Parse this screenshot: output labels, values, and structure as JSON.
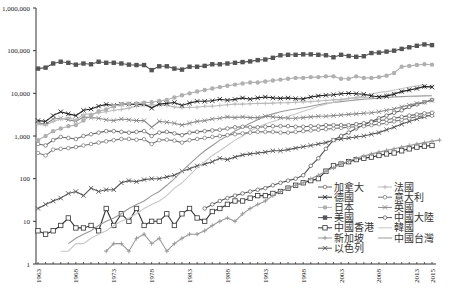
{
  "chart_data": {
    "type": "line",
    "title": "",
    "xlabel": "",
    "ylabel": "",
    "yscale": "log",
    "ylim": [
      1,
      1000000
    ],
    "xlim": [
      1963,
      2015
    ],
    "grid": false,
    "legend_position": "bottom-right",
    "y_ticks": [
      {
        "value": 1,
        "label": "1"
      },
      {
        "value": 10,
        "label": "10"
      },
      {
        "value": 100,
        "label": "100"
      },
      {
        "value": 1000,
        "label": "1,000"
      },
      {
        "value": 10000,
        "label": "10,000"
      },
      {
        "value": 100000,
        "label": "100,000"
      },
      {
        "value": 1000000,
        "label": "1,000,000"
      }
    ],
    "x_ticks": [
      "1963",
      "1968",
      "1973",
      "1978",
      "1983",
      "1988",
      "1993",
      "1998",
      "2003",
      "2008",
      "2013",
      "2015"
    ],
    "legend_columns": [
      [
        "加拿大",
        "德國",
        "日本",
        "美國",
        "中國香港",
        "新加坡",
        "以色列"
      ],
      [
        "法國",
        "意大利",
        "英國",
        "中國大陸",
        "韓國",
        "中國台灣"
      ]
    ],
    "series": [
      {
        "name": "美國",
        "color": "#555555",
        "marker": "square-filled",
        "start": 1963,
        "values": [
          38000,
          40000,
          50000,
          55000,
          52000,
          47000,
          50000,
          48000,
          55000,
          52000,
          52000,
          50000,
          47000,
          46000,
          46000,
          35000,
          43000,
          43000,
          38000,
          36000,
          42000,
          42000,
          44000,
          48000,
          48000,
          50000,
          52000,
          54000,
          56000,
          60000,
          62000,
          68000,
          78000,
          80000,
          80000,
          82000,
          82000,
          80000,
          78000,
          70000,
          80000,
          75000,
          72000,
          74000,
          88000,
          90000,
          95000,
          100000,
          110000,
          120000,
          130000,
          140000,
          135000
        ]
      },
      {
        "name": "日本",
        "color": "#b0b0b0",
        "marker": "circle-filled",
        "start": 1963,
        "values": [
          800,
          1000,
          1300,
          1500,
          1700,
          1800,
          2300,
          3000,
          3800,
          4200,
          5000,
          5500,
          5700,
          5800,
          6000,
          6200,
          6600,
          7000,
          8000,
          9000,
          10000,
          11000,
          12000,
          13000,
          14000,
          15000,
          16000,
          17000,
          18000,
          18000,
          19000,
          20000,
          21000,
          22000,
          23000,
          23000,
          24000,
          24000,
          25000,
          25000,
          22000,
          22000,
          25000,
          23000,
          23000,
          24000,
          26000,
          30000,
          42000,
          44000,
          46000,
          48000,
          47000
        ]
      },
      {
        "name": "德國",
        "color": "#222222",
        "marker": "x",
        "start": 1963,
        "values": [
          2300,
          2200,
          3000,
          3700,
          3300,
          3000,
          4000,
          4300,
          5000,
          5500,
          5200,
          5600,
          5600,
          5500,
          5600,
          4500,
          5600,
          5800,
          6100,
          5200,
          5900,
          6500,
          6500,
          6700,
          7300,
          6900,
          7200,
          7800,
          7300,
          7800,
          8200,
          7800,
          7600,
          7800,
          7500,
          7400,
          8200,
          8700,
          9000,
          9300,
          9800,
          10000,
          9800,
          9500,
          8800,
          8200,
          8600,
          9500,
          11000,
          12000,
          13000,
          14500,
          14000
        ]
      },
      {
        "name": "法國",
        "color": "#bbbbbb",
        "marker": "plus",
        "start": 1963,
        "values": [
          1900,
          1800,
          2200,
          2500,
          2700,
          2400,
          3200,
          3300,
          3500,
          3700,
          4000,
          4200,
          4500,
          5000,
          5200,
          5400,
          5300,
          5200,
          4800,
          4600,
          4700,
          4700,
          5000,
          5000,
          5200,
          5400,
          5600,
          5600,
          5700,
          5800,
          5800,
          5900,
          6000,
          6000,
          6200,
          6300,
          6400,
          6600,
          6800,
          7000,
          7200,
          7600,
          7800,
          8000,
          8200,
          8500,
          9000,
          10000,
          11000,
          12000,
          13000,
          14000,
          14500
        ]
      },
      {
        "name": "英國",
        "color": "#888888",
        "marker": "x",
        "start": 1963,
        "values": [
          2000,
          1900,
          2500,
          2600,
          2400,
          2200,
          2800,
          2700,
          2600,
          2400,
          2300,
          2500,
          2400,
          2300,
          2300,
          1600,
          2200,
          2100,
          2000,
          1800,
          2000,
          2200,
          2300,
          2500,
          2600,
          2800,
          2700,
          2800,
          2700,
          2700,
          2900,
          2800,
          2700,
          2600,
          2600,
          2700,
          2800,
          2900,
          2900,
          3000,
          3100,
          3200,
          3300,
          3400,
          3500,
          3700,
          4000,
          4300,
          4800,
          5300,
          5800,
          6200,
          6800
        ]
      },
      {
        "name": "加拿大",
        "color": "#666666",
        "marker": "circle-open",
        "start": 1963,
        "values": [
          650,
          600,
          800,
          950,
          900,
          850,
          1000,
          1100,
          1200,
          1300,
          1300,
          1250,
          1200,
          1250,
          1300,
          1000,
          1200,
          1250,
          1150,
          1050,
          1200,
          1250,
          1300,
          1350,
          1400,
          1500,
          1600,
          1650,
          1600,
          1600,
          1650,
          1700,
          1700,
          1700,
          1650,
          1650,
          1700,
          1700,
          1800,
          1800,
          1800,
          1800,
          1900,
          2000,
          2100,
          2300,
          2400,
          2600,
          2800,
          3000,
          3200,
          3400,
          3500
        ]
      },
      {
        "name": "意大利",
        "color": "#777777",
        "marker": "circle-open",
        "start": 1963,
        "values": [
          400,
          350,
          480,
          500,
          520,
          550,
          600,
          650,
          700,
          750,
          800,
          850,
          850,
          820,
          840,
          650,
          800,
          820,
          780,
          700,
          800,
          850,
          900,
          950,
          1000,
          1050,
          1100,
          1150,
          1200,
          1250,
          1250,
          1250,
          1200,
          1200,
          1250,
          1300,
          1350,
          1400,
          1450,
          1500,
          1550,
          1600,
          1650,
          1700,
          1800,
          1900,
          2000,
          2200,
          2400,
          2600,
          2800,
          3000,
          3000
        ]
      },
      {
        "name": "中國大陸",
        "color": "#555555",
        "marker": "circle-open",
        "start": 1985,
        "values": [
          20,
          25,
          30,
          35,
          40,
          45,
          50,
          55,
          60,
          70,
          80,
          90,
          100,
          120,
          200,
          300,
          500,
          800,
          1000,
          1200,
          1500,
          1800,
          2200,
          2600,
          3000,
          3500,
          4000,
          4800,
          5500,
          6200,
          7000
        ]
      },
      {
        "name": "韓國",
        "color": "#c8c8c8",
        "marker": "none",
        "start": 1966,
        "values": [
          2,
          2,
          3,
          3,
          4,
          5,
          6,
          8,
          10,
          12,
          15,
          20,
          25,
          30,
          40,
          60,
          80,
          120,
          180,
          250,
          350,
          450,
          600,
          800,
          1000,
          1300,
          1600,
          1900,
          2200,
          2500,
          2900,
          3300,
          3800,
          4300,
          5000,
          5600,
          6200,
          6900,
          7500,
          8200,
          8800,
          9600,
          10500,
          11000,
          12000,
          13000,
          14000,
          15000,
          16000
        ]
      },
      {
        "name": "中國台灣",
        "color": "#999999",
        "marker": "none",
        "start": 1967,
        "values": [
          3,
          4,
          5,
          6,
          8,
          10,
          12,
          15,
          20,
          25,
          30,
          40,
          50,
          70,
          100,
          150,
          220,
          320,
          450,
          600,
          800,
          1000,
          1300,
          1600,
          2000,
          2400,
          2900,
          3300,
          3700,
          4000,
          4300,
          4600,
          5000,
          5400,
          5800,
          6100,
          6400,
          6700,
          7000,
          7300,
          7500,
          7700,
          8000,
          8200,
          8400,
          8500,
          8600,
          8700,
          8800
        ]
      },
      {
        "name": "以色列",
        "color": "#555555",
        "marker": "x",
        "start": 1963,
        "values": [
          20,
          25,
          30,
          35,
          45,
          50,
          40,
          60,
          50,
          55,
          55,
          80,
          90,
          85,
          95,
          100,
          100,
          110,
          120,
          150,
          170,
          200,
          220,
          250,
          300,
          280,
          320,
          360,
          380,
          400,
          420,
          450,
          450,
          480,
          520,
          560,
          600,
          650,
          700,
          800,
          850,
          900,
          950,
          1000,
          1100,
          1200,
          1400,
          1600,
          1900,
          2200,
          2500,
          2800,
          3200
        ]
      },
      {
        "name": "新加坡",
        "color": "#999999",
        "marker": "plus",
        "start": 1972,
        "values": [
          2,
          3,
          3,
          2,
          4,
          5,
          3,
          4,
          2,
          3,
          4,
          5,
          5,
          6,
          8,
          10,
          12,
          10,
          15,
          20,
          25,
          30,
          40,
          50,
          60,
          70,
          80,
          100,
          120,
          150,
          180,
          220,
          260,
          300,
          340,
          380,
          420,
          460,
          500,
          550,
          600,
          650,
          700,
          750,
          800
        ]
      },
      {
        "name": "中國香港",
        "color": "#333333",
        "marker": "square-open",
        "start": 1963,
        "values": [
          6,
          5,
          6,
          8,
          12,
          7,
          7,
          8,
          6,
          20,
          8,
          15,
          10,
          20,
          8,
          10,
          10,
          15,
          8,
          15,
          20,
          12,
          10,
          17,
          20,
          25,
          30,
          30,
          35,
          40,
          40,
          45,
          50,
          60,
          70,
          80,
          90,
          100,
          150,
          200,
          220,
          250,
          280,
          300,
          320,
          350,
          380,
          400,
          450,
          500,
          550,
          580,
          600
        ]
      }
    ]
  }
}
